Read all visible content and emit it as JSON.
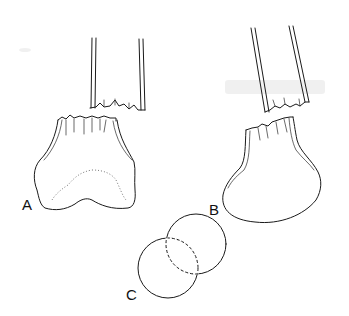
{
  "figure": {
    "panels": [
      {
        "id": "A",
        "label": "A",
        "description": "Fractured bone shaft above a distal end with bilobed base and dotted inner outline"
      },
      {
        "id": "B",
        "label": "B",
        "description": "Angled fractured bone shaft above a rounded, ovoid distal end"
      },
      {
        "id": "C",
        "label": "C",
        "description": "Two overlapping circles with dashed intersection"
      }
    ],
    "colors": {
      "line": "#1a1a1a",
      "background": "#ffffff"
    }
  }
}
